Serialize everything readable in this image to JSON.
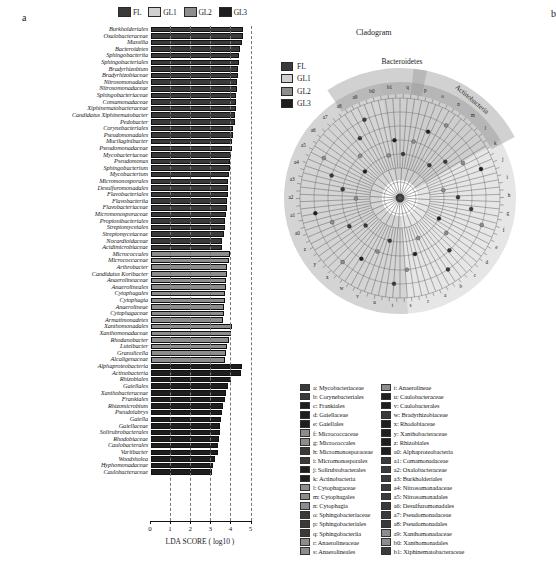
{
  "panels": {
    "a_label": "a",
    "b_label": "b"
  },
  "groups": [
    {
      "key": "FL",
      "label": "FL",
      "color": "#3a3a3a"
    },
    {
      "key": "GL1",
      "label": "GL1",
      "color": "#d0d0d0"
    },
    {
      "key": "GL2",
      "label": "GL2",
      "color": "#8d8d8d"
    },
    {
      "key": "GL3",
      "label": "GL3",
      "color": "#1e1e1e"
    }
  ],
  "chart_data": {
    "type": "bar",
    "title": "",
    "xlabel": "LDA SCORE ( log10 )",
    "ylabel": "",
    "xlim": [
      0,
      5
    ],
    "xticks": [
      0,
      1,
      2,
      3,
      4,
      5
    ],
    "grid": true,
    "orientation": "horizontal",
    "categories": [
      "Burkholderiales",
      "Oxalobacteraceae",
      "Massilia",
      "Bacteroidetes",
      "Sphingobacteriia",
      "Sphingobacteriales",
      "Bradyrhizobium",
      "Bradyrhizobiaceae",
      "Nitrosomonadales",
      "Nitrosomonadaceae",
      "Sphingobacteriaceae",
      "Comamonadaceae",
      "Xiphinematobacteraceae",
      "Candidatus Xiphinematobacter",
      "Pedobacter",
      "Corynebacteriales",
      "Pseudomonadales",
      "Mucilaginibacter",
      "Pseudomonadaceae",
      "Mycobacteriaceae",
      "Pseudomonas",
      "Sphingobacterium",
      "Mycobacterium",
      "Micromonosporales",
      "Desulfuromonadales",
      "Flavobacteriales",
      "Flavobacteriia",
      "Flavobacteriaceae",
      "Micromonosporaceae",
      "Propionibacteriales",
      "Streptomycetales",
      "Streptomycetaceae",
      "Nocardioidaceae",
      "Acidimicrobiaceae",
      "Micrococcales",
      "Micrococcaceae",
      "Arthrobacter",
      "Candidatus Koribacter",
      "Anaerolineaceae",
      "Anaerolineales",
      "Cytophagales",
      "Cytophagia",
      "Anaerolineae",
      "Cytophagaceae",
      "Armatimonadetes",
      "Xanthomonadales",
      "Xanthomonadaceae",
      "Rhodanobacter",
      "Luteibacter",
      "Granulicella",
      "Alcaligenaceae",
      "Alphaproteobacteria",
      "Actinobacteria",
      "Rhizobiales",
      "Gaiellales",
      "Xanthobacteraceae",
      "Frankiales",
      "Rhizomicrobium",
      "Pseudolabrys",
      "Gaiella",
      "Gaiellaceae",
      "Solirubrobacterales",
      "Rhodobiaceae",
      "Caulobacterales",
      "Variibacter",
      "Woodsholea",
      "Hyphomonadaceae",
      "Caulobacteraceae"
    ],
    "values": [
      4.62,
      4.58,
      4.53,
      4.45,
      4.42,
      4.41,
      4.37,
      4.34,
      4.31,
      4.29,
      4.27,
      4.25,
      4.23,
      4.21,
      4.19,
      4.11,
      4.08,
      4.05,
      4.03,
      4.0,
      3.97,
      3.95,
      3.92,
      3.88,
      3.86,
      3.84,
      3.82,
      3.8,
      3.76,
      3.73,
      3.7,
      3.67,
      3.58,
      3.55,
      3.98,
      3.9,
      3.83,
      3.8,
      3.76,
      3.74,
      3.72,
      3.7,
      3.68,
      3.66,
      3.62,
      4.05,
      4.0,
      3.9,
      3.82,
      3.77,
      3.72,
      4.55,
      4.5,
      4.0,
      3.85,
      3.75,
      3.7,
      3.62,
      3.57,
      3.52,
      3.48,
      3.44,
      3.4,
      3.38,
      3.34,
      3.2,
      3.12,
      3.05
    ],
    "series_group": [
      "FL",
      "FL",
      "FL",
      "FL",
      "FL",
      "FL",
      "FL",
      "FL",
      "FL",
      "FL",
      "FL",
      "FL",
      "FL",
      "FL",
      "FL",
      "FL",
      "FL",
      "FL",
      "FL",
      "FL",
      "FL",
      "FL",
      "FL",
      "FL",
      "FL",
      "FL",
      "FL",
      "FL",
      "FL",
      "FL",
      "FL",
      "FL",
      "FL",
      "FL",
      "GL2",
      "GL2",
      "GL2",
      "GL2",
      "GL2",
      "GL2",
      "GL2",
      "GL2",
      "GL2",
      "GL2",
      "GL2",
      "GL2",
      "GL2",
      "GL2",
      "GL2",
      "GL2",
      "GL2",
      "GL3",
      "GL3",
      "GL3",
      "GL3",
      "GL3",
      "GL3",
      "GL3",
      "GL3",
      "GL3",
      "GL3",
      "GL3",
      "GL3",
      "GL3",
      "GL3",
      "GL3",
      "GL3",
      "GL3"
    ]
  },
  "cladogram": {
    "title": "Cladogram",
    "wedges": [
      {
        "label": "Bacteroidetes"
      },
      {
        "label": "Actinobacteria"
      }
    ],
    "node_letters": [
      "q",
      "p",
      "o",
      "n",
      "m",
      "l",
      "k",
      "j",
      "i",
      "h",
      "g",
      "f",
      "e",
      "d",
      "c",
      "b",
      "a",
      "r",
      "s",
      "t",
      "u",
      "v",
      "w",
      "x",
      "y",
      "z",
      "a0",
      "a1",
      "a2",
      "a3",
      "a4",
      "a5",
      "a6",
      "a7",
      "a8",
      "a9",
      "b0",
      "b1"
    ]
  },
  "key": {
    "left": [
      {
        "code": "a",
        "name": "Mycobacteriaceae",
        "group": "FL"
      },
      {
        "code": "b",
        "name": "Corynebacteriales",
        "group": "FL"
      },
      {
        "code": "c",
        "name": "Frankiales",
        "group": "GL3"
      },
      {
        "code": "d",
        "name": "Gaiellaceae",
        "group": "GL3"
      },
      {
        "code": "e",
        "name": "Gaiellales",
        "group": "GL3"
      },
      {
        "code": "f",
        "name": "Micrococcaceae",
        "group": "GL2"
      },
      {
        "code": "g",
        "name": "Micrococcales",
        "group": "GL2"
      },
      {
        "code": "h",
        "name": "Micromonosporaceae",
        "group": "FL"
      },
      {
        "code": "i",
        "name": "Micromonosporales",
        "group": "FL"
      },
      {
        "code": "j",
        "name": "Solirubrobacterales",
        "group": "GL3"
      },
      {
        "code": "k",
        "name": "Actinobacteria",
        "group": "GL3"
      },
      {
        "code": "l",
        "name": "Cytophagaceae",
        "group": "GL2"
      },
      {
        "code": "m",
        "name": "Cytophagales",
        "group": "GL2"
      },
      {
        "code": "n",
        "name": "Cytophagia",
        "group": "GL2"
      },
      {
        "code": "o",
        "name": "Sphingobacteriaceae",
        "group": "FL"
      },
      {
        "code": "p",
        "name": "Sphingobacteriales",
        "group": "FL"
      },
      {
        "code": "q",
        "name": "Sphingobacteriia",
        "group": "FL"
      },
      {
        "code": "r",
        "name": "Anaerolineaceae",
        "group": "GL2"
      },
      {
        "code": "s",
        "name": "Anaerolineales",
        "group": "GL2"
      }
    ],
    "right": [
      {
        "code": "t",
        "name": "Anaerolineae",
        "group": "GL2"
      },
      {
        "code": "u",
        "name": "Caulobacteraceae",
        "group": "GL3"
      },
      {
        "code": "v",
        "name": "Caulobacterales",
        "group": "GL3"
      },
      {
        "code": "w",
        "name": "Bradyrhizobiaceae",
        "group": "FL"
      },
      {
        "code": "x",
        "name": "Rhodobiaceae",
        "group": "GL3"
      },
      {
        "code": "y",
        "name": "Xanthobacteraceae",
        "group": "GL3"
      },
      {
        "code": "z",
        "name": "Rhizobiales",
        "group": "GL3"
      },
      {
        "code": "a0",
        "name": "Alphaproteobacteria",
        "group": "GL3"
      },
      {
        "code": "a1",
        "name": "Comamonadaceae",
        "group": "FL"
      },
      {
        "code": "a2",
        "name": "Oxalobacteraceae",
        "group": "FL"
      },
      {
        "code": "a3",
        "name": "Burkholderiales",
        "group": "FL"
      },
      {
        "code": "a4",
        "name": "Nitrosomonadaceae",
        "group": "FL"
      },
      {
        "code": "a5",
        "name": "Nitrosomonadales",
        "group": "FL"
      },
      {
        "code": "a6",
        "name": "Desulfuromonadales",
        "group": "FL"
      },
      {
        "code": "a7",
        "name": "Pseudomonadaceae",
        "group": "FL"
      },
      {
        "code": "a8",
        "name": "Pseudomonadales",
        "group": "FL"
      },
      {
        "code": "a9",
        "name": "Xanthomonadaceae",
        "group": "GL2"
      },
      {
        "code": "b0",
        "name": "Xanthomonadales",
        "group": "GL2"
      },
      {
        "code": "b1",
        "name": "Xiphinematobacteraceae",
        "group": "FL"
      }
    ]
  }
}
